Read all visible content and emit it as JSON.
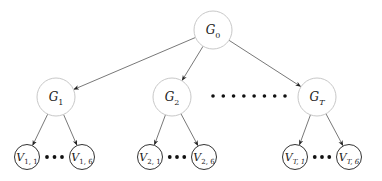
{
  "diagram": {
    "type": "tree",
    "root": {
      "id": "G0",
      "symbol": "G",
      "subscript": "0",
      "cx": 213,
      "cy": 30,
      "r": 19
    },
    "groups": [
      {
        "id": "G1",
        "symbol": "G",
        "subscript": "1",
        "cx": 56,
        "cy": 97,
        "r": 19,
        "leaves": [
          {
            "id": "V1_1",
            "symbol": "V",
            "subscript": "1, 1",
            "cx": 27,
            "cy": 157
          },
          {
            "id": "V1_6",
            "symbol": "V",
            "subscript": "1, 6",
            "cx": 82,
            "cy": 157
          }
        ]
      },
      {
        "id": "G2",
        "symbol": "G",
        "subscript": "2",
        "cx": 172,
        "cy": 97,
        "r": 19,
        "leaves": [
          {
            "id": "V2_1",
            "symbol": "V",
            "subscript": "2, 1",
            "cx": 150,
            "cy": 157
          },
          {
            "id": "V2_6",
            "symbol": "V",
            "subscript": "2, 6",
            "cx": 204,
            "cy": 157
          }
        ]
      },
      {
        "id": "GT",
        "symbol": "G",
        "subscript": "T",
        "cx": 317,
        "cy": 97,
        "r": 19,
        "leaves": [
          {
            "id": "VT_1",
            "symbol": "V",
            "subscript": "T, 1",
            "cx": 295,
            "cy": 157
          },
          {
            "id": "VT_6",
            "symbol": "V",
            "subscript": "T, 6",
            "cx": 349,
            "cy": 157
          }
        ]
      }
    ],
    "leaf_radius": 12.5,
    "group_ellipsis_dots": 8,
    "leaf_ellipsis_dots": 3,
    "colors": {
      "group_stroke": "#c8c8c8",
      "leaf_stroke": "#333333",
      "edge": "#555555",
      "dot": "#111111",
      "text": "#222222"
    }
  }
}
